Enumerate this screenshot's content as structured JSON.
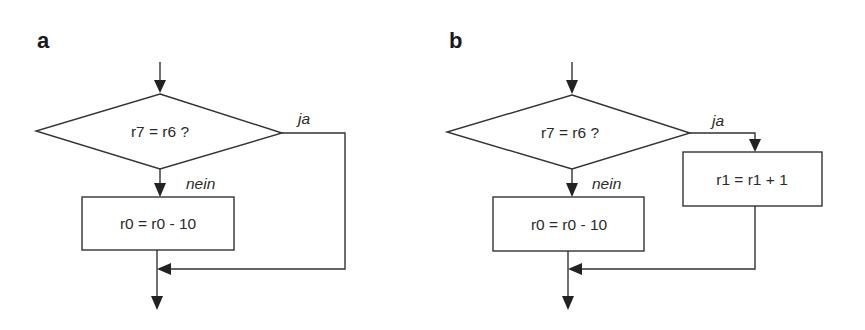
{
  "panels": [
    {
      "label": "a",
      "decision": {
        "text": "r7 = r6 ?"
      },
      "branch_yes": {
        "label": "ja"
      },
      "branch_no": {
        "label": "nein"
      },
      "process_no": {
        "text": "r0 = r0 - 10"
      }
    },
    {
      "label": "b",
      "decision": {
        "text": "r7 = r6 ?"
      },
      "branch_yes": {
        "label": "ja"
      },
      "branch_no": {
        "label": "nein"
      },
      "process_no": {
        "text": "r0 = r0 - 10"
      },
      "process_yes": {
        "text": "r1 = r1 + 1"
      }
    }
  ],
  "colors": {
    "stroke": "#333333",
    "text": "#2a2a2a",
    "background": "#ffffff"
  }
}
